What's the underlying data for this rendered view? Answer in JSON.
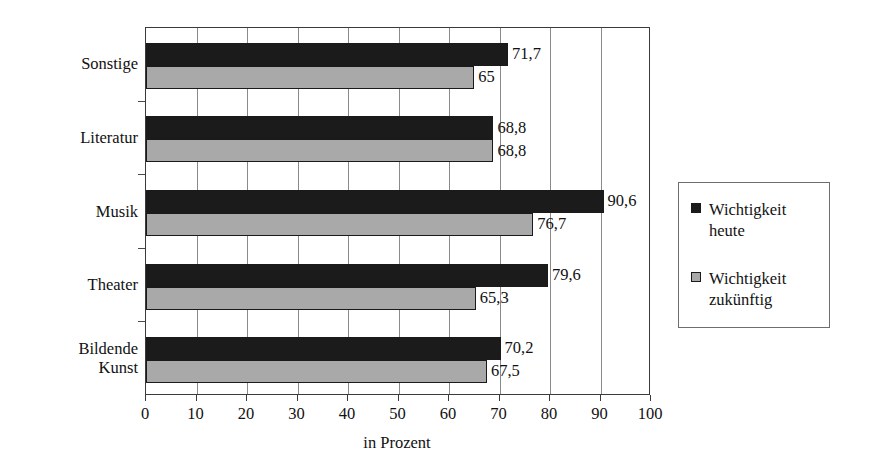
{
  "chart_data": {
    "type": "bar",
    "orientation": "horizontal",
    "title": "",
    "xlabel": "in Prozent",
    "ylabel": "",
    "xlim": [
      0,
      100
    ],
    "xticks": [
      0,
      10,
      20,
      30,
      40,
      50,
      60,
      70,
      80,
      90,
      100
    ],
    "xtick_labels": [
      "0",
      "10",
      "20",
      "30",
      "40",
      "50",
      "60",
      "70",
      "80",
      "90",
      "100"
    ],
    "grid": true,
    "grid_axis": "x",
    "legend_position": "right",
    "categories": [
      "Sonstige",
      "Literatur",
      "Musik",
      "Theater",
      "Bildende Kunst"
    ],
    "series": [
      {
        "name": "Wichtigkeit heute",
        "color": "#1b1b1b",
        "values": [
          71.7,
          68.8,
          90.6,
          79.6,
          70.2
        ],
        "labels": [
          "71,7",
          "68,8",
          "90,6",
          "79,6",
          "70,2"
        ]
      },
      {
        "name": "Wichtigkeit zukünftig",
        "color": "#a9a9a9",
        "values": [
          65,
          68.8,
          76.7,
          65.3,
          67.5
        ],
        "labels": [
          "65",
          "68,8",
          "76,7",
          "65,3",
          "67,5"
        ]
      }
    ]
  },
  "axis": {
    "x_title": "in Prozent"
  },
  "legend": {
    "entries": [
      {
        "label": "Wichtigkeit\nheute",
        "swatch": "today"
      },
      {
        "label": "Wichtigkeit\nzukünftig",
        "swatch": "future"
      }
    ]
  }
}
